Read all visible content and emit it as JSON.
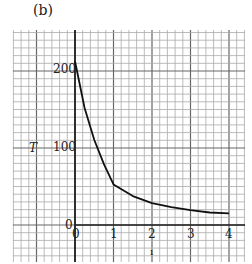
{
  "panel_label": "(b)",
  "chart_data": {
    "type": "line",
    "title": "",
    "xlabel": "t",
    "ylabel": "T",
    "xlim": [
      0,
      4
    ],
    "ylim": [
      0,
      200
    ],
    "x_ticks": [
      "0",
      "1",
      "2",
      "3",
      "4"
    ],
    "y_ticks": [
      "0",
      "100",
      "200"
    ],
    "grid": true,
    "series": [
      {
        "name": "T",
        "x": [
          0,
          0.25,
          0.5,
          0.75,
          1,
          1.5,
          2,
          2.5,
          3,
          3.5,
          4
        ],
        "values": [
          210,
          150,
          109,
          78,
          52,
          37,
          28,
          23,
          19,
          16,
          15
        ]
      }
    ]
  }
}
